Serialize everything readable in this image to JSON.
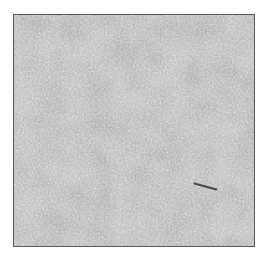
{
  "image": {
    "type": "grayscale histology micrograph",
    "description": "Densely packed small round cells with dark nuclei on a lighter mottled background",
    "colors": {
      "background": "#ffffff",
      "frame": "#5a5a5a",
      "tissue_base": "#9a9a9a",
      "light_areas": "#d8d8d8",
      "dark_nuclei": "#3a3a3a"
    },
    "features": [
      {
        "name": "dark-streak",
        "x": 195,
        "y": 186,
        "length": 22,
        "angle_deg": 15
      }
    ]
  }
}
